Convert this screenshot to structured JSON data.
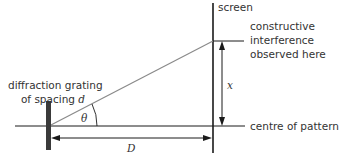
{
  "diagram": {
    "type": "diffraction-grating-geometry",
    "labels": {
      "screen": "screen",
      "constructive_line1": "constructive",
      "constructive_line2": "interference",
      "constructive_line3": "observed here",
      "grating_line1": "diffraction grating",
      "grating_line2_prefix": "of spacing ",
      "grating_symbol": "d",
      "angle_symbol": "θ",
      "x_symbol": "x",
      "D_symbol": "D",
      "centre": "centre of pattern"
    },
    "colors": {
      "line": "#1a1a1a",
      "ray": "#808080",
      "grating": "#3a3a3a",
      "text": "#333333"
    }
  }
}
